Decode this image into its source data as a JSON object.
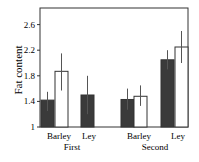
{
  "chart_data": {
    "type": "bar",
    "title": "",
    "xlabel": "",
    "ylabel": "Fat content",
    "ylim": [
      1,
      2.8
    ],
    "yticks": [
      1,
      1.4,
      1.8,
      2.2,
      2.6
    ],
    "ytick_labels": [
      "1",
      "1.4",
      "1.8",
      "2.2",
      "2.6"
    ],
    "groups": [
      {
        "label": "First",
        "categories": [
          "Barley",
          "Ley"
        ]
      },
      {
        "label": "Second",
        "categories": [
          "Barley",
          "Ley"
        ]
      }
    ],
    "categories": [
      "First Barley",
      "First Ley",
      "Second Barley",
      "Second Ley"
    ],
    "series": [
      {
        "name": "dark",
        "color": "#3a3a3a",
        "values": [
          1.42,
          1.5,
          1.43,
          2.05
        ],
        "err_low": [
          1.25,
          1.2,
          1.27,
          1.9
        ],
        "err_high": [
          1.55,
          1.8,
          1.6,
          2.2
        ]
      },
      {
        "name": "white",
        "color": "#ffffff",
        "values": [
          1.87,
          null,
          1.48,
          2.25
        ],
        "err_low": [
          1.57,
          null,
          1.33,
          2.0
        ],
        "err_high": [
          2.15,
          null,
          1.65,
          2.5
        ]
      }
    ],
    "grid": false,
    "legend": null
  },
  "labels": {
    "ylabel": "Fat content",
    "ticks": [
      "2.6",
      "2.2",
      "1.8",
      "1.4",
      "1"
    ],
    "cat": [
      "Barley",
      "Ley",
      "Barley",
      "Ley"
    ],
    "groups": [
      "First",
      "Second"
    ]
  }
}
